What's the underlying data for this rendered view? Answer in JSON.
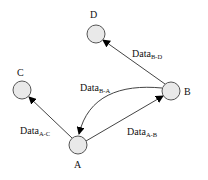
{
  "diagram": {
    "nodes": [
      {
        "id": "A",
        "label": "A",
        "cx": 78,
        "cy": 145,
        "r": 9,
        "lx": 74,
        "ly": 168
      },
      {
        "id": "B",
        "label": "B",
        "cx": 171,
        "cy": 91,
        "r": 9,
        "lx": 184,
        "ly": 95
      },
      {
        "id": "C",
        "label": "C",
        "cx": 22,
        "cy": 90,
        "r": 9,
        "lx": 17,
        "ly": 76
      },
      {
        "id": "D",
        "label": "D",
        "cx": 96,
        "cy": 34,
        "r": 9,
        "lx": 90,
        "ly": 18
      }
    ],
    "edges": [
      {
        "from": "A",
        "to": "C",
        "label_main": "Data",
        "label_sub": "A-C"
      },
      {
        "from": "A",
        "to": "B",
        "label_main": "Data",
        "label_sub": "A-B"
      },
      {
        "from": "B",
        "to": "D",
        "label_main": "Data",
        "label_sub": "B-D"
      },
      {
        "from": "B",
        "to": "A",
        "label_main": "Data",
        "label_sub": "B-A",
        "curved": true
      }
    ],
    "colors": {
      "node_fill": "#e9e9e9",
      "node_stroke": "#555555",
      "edge": "#444444",
      "arrowhead": "#000000"
    }
  }
}
